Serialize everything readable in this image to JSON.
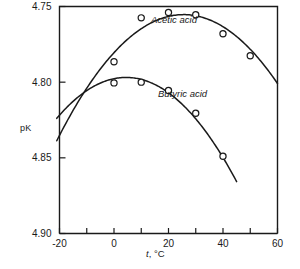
{
  "chart_data": {
    "type": "line",
    "title": "",
    "xlabel": "t, °C",
    "ylabel": "pK",
    "xlim": [
      -20,
      60
    ],
    "ylim": [
      4.75,
      4.9
    ],
    "y_axis_inverted": true,
    "grid": false,
    "legend_position": "inline-annotations",
    "xticks": [
      -20,
      -10,
      0,
      10,
      20,
      30,
      40,
      50,
      60
    ],
    "xtick_labels": [
      "-20",
      "",
      "0",
      "",
      "20",
      "",
      "40",
      "",
      "60"
    ],
    "yticks": [
      4.75,
      4.8,
      4.85,
      4.9
    ],
    "ytick_labels": [
      "4.75",
      "4.80",
      "4.85",
      "4.90"
    ],
    "marker": "open-circle",
    "series": [
      {
        "name": "Acetic acid",
        "label_text": "Acetic acid",
        "x": [
          0,
          10,
          20,
          30,
          40,
          50
        ],
        "y": [
          4.7865,
          4.7575,
          4.754,
          4.7555,
          4.768,
          4.7825
        ],
        "curve_x_start": -21,
        "curve_y_start": 4.8385,
        "curve_x_end": 60,
        "curve_y_end": 4.7965
      },
      {
        "name": "Butyric acid",
        "label_text": "Butyric acid",
        "x": [
          0,
          10,
          20,
          30,
          40
        ],
        "y": [
          4.8005,
          4.8,
          4.8055,
          4.8205,
          4.849
        ],
        "curve_x_start": -21,
        "curve_y_start": 4.8225,
        "curve_x_end": 45,
        "curve_y_end": 4.8685
      }
    ]
  },
  "axes": {
    "ylabel_text": "pK",
    "xlabel_prefix": "t",
    "xlabel_suffix": ", °C"
  },
  "colors": {
    "line": "#1a1a1a",
    "marker_fill": "#ffffff",
    "axis": "#1a1a1a",
    "background": "#ffffff"
  }
}
